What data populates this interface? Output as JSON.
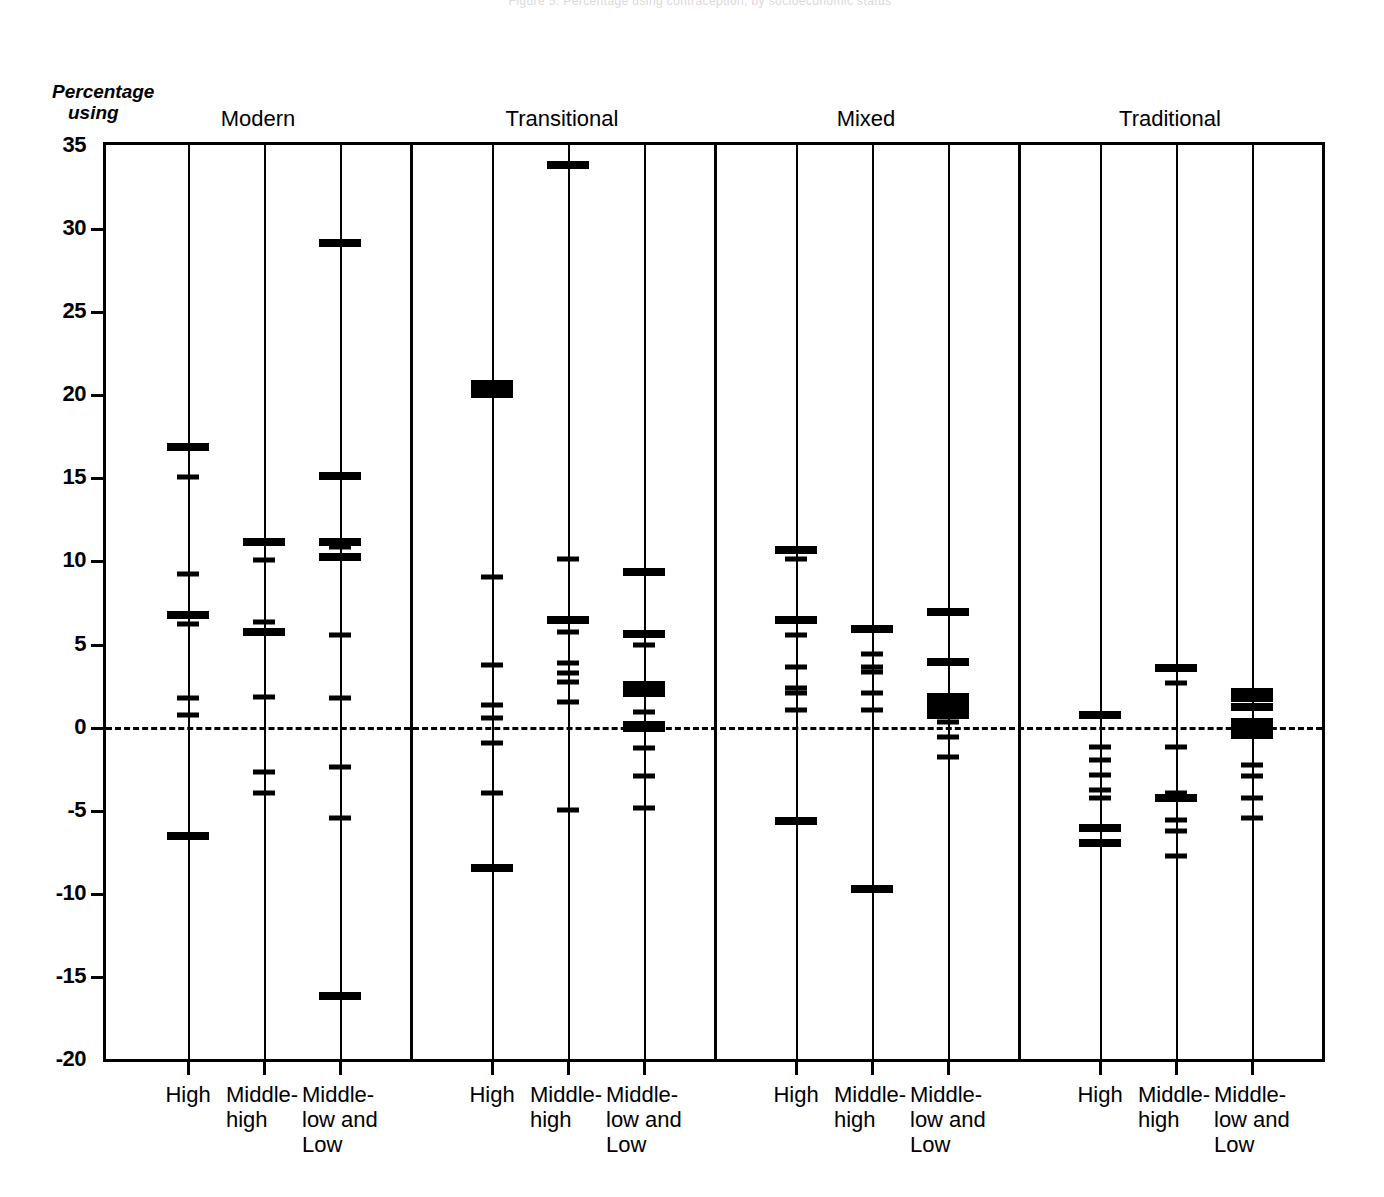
{
  "running_head": "Figure 5. Percentage using contraception, by socioeconomic status",
  "axis": {
    "y_title_line1": "Percentage",
    "y_title_line2": "using",
    "y_ticks": [
      35,
      30,
      25,
      20,
      15,
      10,
      5,
      0,
      -5,
      -10,
      -15,
      -20
    ],
    "y_tick_labels": [
      "35",
      "30",
      "25",
      "20",
      "15",
      "10",
      "5",
      "0",
      "-5",
      "-10",
      "-15",
      "-20"
    ],
    "y_min": -20,
    "y_max": 35,
    "zero_reference": 0
  },
  "groups": [
    {
      "label": "Modern"
    },
    {
      "label": "Transitional"
    },
    {
      "label": "Mixed"
    },
    {
      "label": "Traditional"
    }
  ],
  "category_labels": [
    "High",
    "Middle-\nhigh",
    "Middle-\nlow and\nLow"
  ],
  "chart_data": {
    "type": "scatter",
    "title": "",
    "subtitle": "",
    "xlabel": "",
    "ylabel": "Percentage using",
    "ylim": [
      -20,
      35
    ],
    "grid": false,
    "legend": "none",
    "axis_note": "Dashed horizontal reference line at 0. Vertical rule per category; horizontal dashes mark individual observations.",
    "group_names": [
      "Modern",
      "Transitional",
      "Mixed",
      "Traditional"
    ],
    "category_names": [
      "High",
      "Middle-high",
      "Middle-low and Low"
    ],
    "strips": [
      {
        "group": "Modern",
        "category": "High",
        "values": [
          16.8,
          15.0,
          9.2,
          6.7,
          6.2,
          1.7,
          0.7,
          -6.6
        ],
        "weights": [
          2,
          1,
          1,
          2,
          1,
          1,
          1,
          2
        ]
      },
      {
        "group": "Modern",
        "category": "Middle-high",
        "values": [
          11.1,
          10.0,
          6.3,
          5.7,
          1.8,
          -2.7,
          -4.0
        ],
        "weights": [
          2,
          1,
          1,
          2,
          1,
          1,
          1
        ]
      },
      {
        "group": "Modern",
        "category": "Middle-low and Low",
        "values": [
          29.1,
          15.1,
          11.1,
          10.8,
          10.2,
          5.5,
          1.7,
          -2.4,
          -5.5,
          -16.2
        ],
        "weights": [
          2,
          2,
          2,
          1,
          2,
          1,
          1,
          1,
          1,
          2
        ]
      },
      {
        "group": "Transitional",
        "category": "High",
        "values": [
          20.6,
          20.3,
          20.0,
          9.0,
          3.7,
          1.3,
          0.5,
          -1.0,
          -4.0,
          -8.5
        ],
        "weights": [
          2,
          2,
          2,
          1,
          1,
          1,
          1,
          1,
          1,
          2
        ]
      },
      {
        "group": "Transitional",
        "category": "Middle-high",
        "values": [
          33.8,
          10.1,
          6.4,
          5.7,
          3.8,
          3.2,
          2.7,
          1.5,
          -5.0
        ],
        "weights": [
          2,
          1,
          2,
          1,
          1,
          1,
          1,
          1,
          1
        ]
      },
      {
        "group": "Transitional",
        "category": "Middle-low and Low",
        "values": [
          9.3,
          5.6,
          4.9,
          2.5,
          2.0,
          0.9,
          0.1,
          -0.1,
          -1.3,
          -3.0,
          -4.9
        ],
        "weights": [
          2,
          2,
          1,
          2,
          2,
          1,
          2,
          2,
          1,
          1,
          1
        ]
      },
      {
        "group": "Mixed",
        "category": "High",
        "values": [
          10.6,
          10.1,
          6.4,
          5.5,
          3.6,
          2.3,
          2.0,
          1.0,
          -5.7
        ],
        "weights": [
          2,
          1,
          2,
          1,
          1,
          1,
          1,
          1,
          2
        ]
      },
      {
        "group": "Mixed",
        "category": "Middle-high",
        "values": [
          5.9,
          4.4,
          3.6,
          3.3,
          2.0,
          1.0,
          -9.8
        ],
        "weights": [
          2,
          1,
          1,
          1,
          1,
          1,
          2
        ]
      },
      {
        "group": "Mixed",
        "category": "Middle-low and Low",
        "values": [
          6.9,
          3.9,
          1.8,
          1.5,
          1.2,
          0.9,
          0.7,
          0.3,
          -0.6,
          -1.8
        ],
        "weights": [
          2,
          2,
          2,
          2,
          2,
          2,
          2,
          1,
          1,
          1
        ]
      },
      {
        "group": "Traditional",
        "category": "High",
        "values": [
          0.7,
          -1.2,
          -2.0,
          -2.9,
          -3.8,
          -4.3,
          -6.1,
          -7.0
        ],
        "weights": [
          2,
          1,
          1,
          1,
          1,
          1,
          2,
          2
        ]
      },
      {
        "group": "Traditional",
        "category": "Middle-high",
        "values": [
          3.5,
          2.6,
          -1.2,
          -4.0,
          -4.3,
          -5.6,
          -6.3,
          -7.8
        ],
        "weights": [
          2,
          1,
          1,
          1,
          2,
          1,
          1,
          1
        ]
      },
      {
        "group": "Traditional",
        "category": "Middle-low and Low",
        "values": [
          2.1,
          1.7,
          1.2,
          0.3,
          0.0,
          -0.5,
          -2.3,
          -3.0,
          -4.3,
          -5.5
        ],
        "weights": [
          2,
          2,
          2,
          2,
          2,
          2,
          1,
          1,
          1,
          1
        ]
      }
    ]
  }
}
